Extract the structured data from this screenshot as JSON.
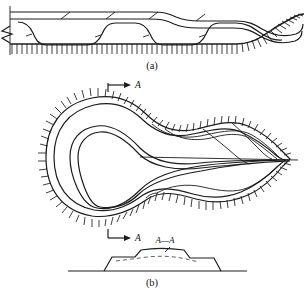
{
  "figure": {
    "background_color": "#ffffff",
    "line_color": "#1c1c1c",
    "panels": [
      {
        "id": "a",
        "caption": "(a)",
        "type": "cross-section",
        "description": "Cross-section through a stack of thrust sheets with hachured (barbed) thrust-fault traces; left edge terminated by a zig-zag break symbol, right end curving upward."
      },
      {
        "id": "b",
        "caption": "(b)",
        "type": "map-view",
        "description": "Map view of a doubly-plunging recumbent nappe with closed, nested fold-trace outlines and hachures on the outer boundary, converging to a point at the right."
      }
    ],
    "labels": {
      "section_line_top": "A",
      "section_line_bottom": "A",
      "section_profile": "A—A"
    },
    "captions": {
      "panel_a": "(a)",
      "panel_b": "(b)"
    },
    "profile": {
      "label": "A—A",
      "description": "Trapezoidal topographic/structural profile with an internal dashed horizon."
    }
  }
}
